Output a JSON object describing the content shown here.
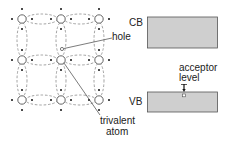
{
  "diagram": {
    "labels": {
      "hole": "hole",
      "trivalent_line1": "trivalent",
      "trivalent_line2": "atom",
      "cb": "CB",
      "vb": "VB",
      "acceptor_line1": "acceptor",
      "acceptor_line2": "level"
    },
    "colors": {
      "band_fill": "#cfcfcf",
      "band_border": "#555555",
      "bond_dash": "#8a8a8a",
      "atom_stroke": "#555555",
      "electron": "#111111"
    }
  }
}
